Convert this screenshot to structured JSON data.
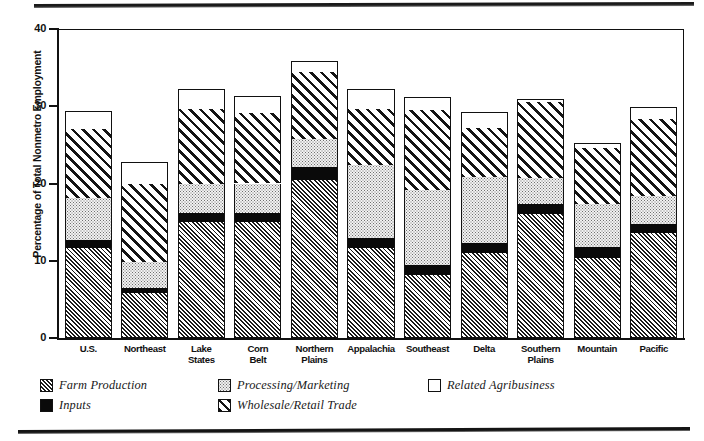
{
  "chart_data": {
    "type": "bar",
    "subtype": "stacked-bar",
    "title": "",
    "xlabel": "",
    "ylabel": "Percentage of Total Nonmetro Employment",
    "ylim": [
      0,
      40
    ],
    "yticks": [
      0,
      10,
      20,
      30,
      40
    ],
    "ytick_labels": [
      "0",
      "10",
      "20",
      "30",
      "40"
    ],
    "grid": false,
    "legend_position": "bottom-left",
    "categories": [
      "U.S.",
      "Northeast",
      "Lake States",
      "Corn Belt",
      "Northern Plains",
      "Appalachia",
      "Southeast",
      "Delta",
      "Southern Plains",
      "Mountain",
      "Pacific"
    ],
    "series": [
      {
        "name": "Farm Production",
        "pattern": "dense-diagonal-hatch",
        "values": [
          11.7,
          5.8,
          15.0,
          15.0,
          20.5,
          11.7,
          8.2,
          11.0,
          16.0,
          10.4,
          13.6
        ]
      },
      {
        "name": "Inputs",
        "pattern": "solid-black",
        "values": [
          1.0,
          0.7,
          1.2,
          1.2,
          1.6,
          1.3,
          1.2,
          1.3,
          1.3,
          1.4,
          1.1
        ]
      },
      {
        "name": "Processing/Marketing",
        "pattern": "light-dotted",
        "values": [
          5.4,
          3.4,
          3.7,
          3.8,
          3.6,
          9.4,
          9.8,
          8.5,
          3.4,
          5.6,
          3.7
        ]
      },
      {
        "name": "Wholesale/Retail Trade",
        "pattern": "wide-diagonal-hatch",
        "values": [
          8.9,
          10.0,
          9.7,
          9.1,
          8.7,
          7.3,
          10.3,
          6.4,
          9.9,
          7.2,
          10.0
        ]
      },
      {
        "name": "Related Agribusiness",
        "pattern": "white-open",
        "values": [
          2.4,
          2.9,
          2.6,
          2.2,
          1.5,
          2.5,
          1.7,
          2.1,
          0.3,
          0.7,
          1.5
        ]
      }
    ],
    "totals": [
      29.4,
      22.8,
      32.2,
      31.3,
      35.9,
      32.2,
      31.2,
      29.3,
      30.9,
      25.3,
      29.9
    ]
  },
  "axis": {
    "y_title": "Percentage of Total Nonmetro Employment",
    "zero_label": "0"
  },
  "legend": {
    "items": [
      {
        "label": "Farm Production",
        "pattern": "farm"
      },
      {
        "label": "Inputs",
        "pattern": "inputs"
      },
      {
        "label": "Processing/Marketing",
        "pattern": "proc"
      },
      {
        "label": "Wholesale/Retail Trade",
        "pattern": "whole"
      },
      {
        "label": "Related Agribusiness",
        "pattern": "related"
      }
    ]
  }
}
